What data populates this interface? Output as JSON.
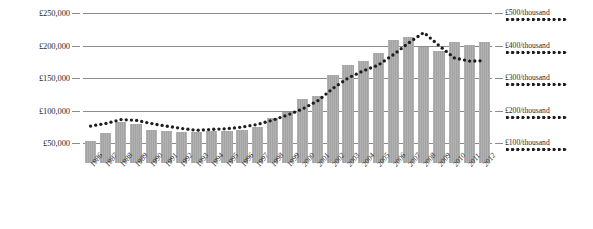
{
  "chart_data": {
    "type": "bar",
    "title": "",
    "subtitle": "",
    "xlabel": "",
    "ylabel": "",
    "grid": true,
    "legend_position": "right",
    "categories": [
      "1986",
      "1987",
      "1988",
      "1989",
      "1990",
      "1991",
      "1992",
      "1993",
      "1994",
      "1995",
      "1996",
      "1997",
      "1998",
      "1999",
      "2000",
      "2001",
      "2002",
      "2003",
      "2004",
      "2005",
      "2006",
      "2007",
      "2008",
      "2009",
      "2010",
      "2011",
      "2012"
    ],
    "axes": {
      "left": {
        "label": "",
        "tick_labels": [
          "£250,000",
          "£200,000",
          "£150,000",
          "£100,000",
          "£50,000"
        ],
        "tick_values": [
          250000,
          200000,
          150000,
          100000,
          50000
        ],
        "ylim": [
          0,
          250000
        ],
        "currency": "£"
      },
      "right": {
        "label": "",
        "tick_labels": [
          "£500/thousand",
          "£400/thousand",
          "£300/thousand",
          "£200/thousand",
          "£100/thousand"
        ],
        "tick_values": [
          500,
          400,
          300,
          200,
          100
        ],
        "ylim": [
          0,
          500
        ],
        "unit": "£/thousand"
      }
    },
    "series": [
      {
        "name": "£",
        "render": "bar",
        "axis": "left",
        "color": "#a3a3a3",
        "values": [
          53000,
          65000,
          83000,
          80000,
          70000,
          68000,
          67000,
          67000,
          69000,
          68000,
          70000,
          74000,
          88000,
          97000,
          117000,
          123000,
          155000,
          170000,
          176000,
          189000,
          208000,
          213000,
          197000,
          192000,
          205000,
          201000,
          205000
        ]
      },
      {
        "name": "£/thousand",
        "render": "dotted-line",
        "axis": "right",
        "color": "#1d1d1d",
        "values": [
          152,
          160,
          172,
          170,
          160,
          152,
          145,
          139,
          142,
          144,
          149,
          157,
          170,
          186,
          205,
          230,
          268,
          300,
          322,
          340,
          372,
          408,
          440,
          400,
          362,
          352,
          353
        ]
      }
    ],
    "legend": [
      {
        "label": "£500/thousand",
        "style": "dotted"
      },
      {
        "label": "£400/thousand",
        "style": "dotted"
      },
      {
        "label": "£300/thousand",
        "style": "dotted"
      },
      {
        "label": "£200/thousand",
        "style": "dotted"
      },
      {
        "label": "£100/thousand",
        "style": "dotted"
      }
    ],
    "colors": {
      "bar": "#a3a3a3",
      "line": "#1d1d1d",
      "grid": "#8c8c8c",
      "text": "#2b2b2b",
      "background": "#ffffff"
    }
  }
}
